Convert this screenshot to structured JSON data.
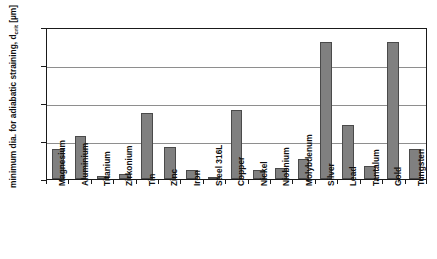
{
  "chart_data": {
    "type": "bar",
    "title": "",
    "xlabel": "",
    "ylabel": "minimum dia. for adiabatic straining, d",
    "ylabel_sub": "crit",
    "ylabel_unit": "[µm]",
    "ylim": [
      0,
      20
    ],
    "yticks": [
      20,
      15,
      10,
      5,
      0
    ],
    "grid": true,
    "legend": "none",
    "bar_color": "#808080",
    "bar_edge_color": "#4a4a4a",
    "axis_color": "#1a1a1a",
    "grid_color": "#8e8e8e",
    "categories": [
      "Magnesium",
      "Aluminium",
      "Titanium",
      "Zirkonium",
      "Tin",
      "Zinc",
      "Iron",
      "Steel 316L",
      "Copper",
      "Nickel",
      "Niobnium",
      "Molybdenum",
      "Silver",
      "Lead",
      "Tantalum",
      "Gold",
      "Tungsten"
    ],
    "values": [
      3.9,
      5.7,
      0.4,
      0.7,
      8.7,
      4.2,
      1.2,
      0.2,
      9.1,
      1.25,
      1.5,
      2.6,
      18.0,
      7.1,
      1.7,
      18.0,
      4.0
    ]
  }
}
